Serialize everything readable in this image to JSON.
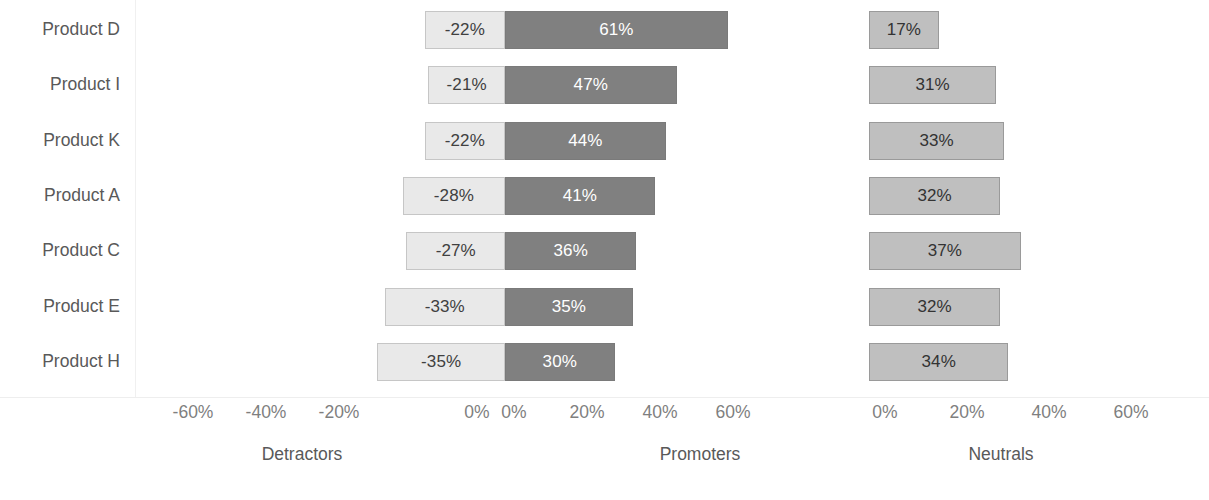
{
  "chart_data": {
    "type": "bar",
    "title": "",
    "subtitle": "",
    "xlabel": "",
    "ylabel": "",
    "orientation": "horizontal",
    "grid": false,
    "legend": "none",
    "categories": [
      "Product D",
      "Product I",
      "Product K",
      "Product A",
      "Product C",
      "Product E",
      "Product H"
    ],
    "series": [
      {
        "name": "Detractors",
        "values": [
          -22,
          -21,
          -22,
          -28,
          -27,
          -33,
          -35
        ],
        "labels": [
          "-22%",
          "-21%",
          "-22%",
          "-28%",
          "-27%",
          "-33%",
          "-35%"
        ],
        "color": "#E9E9E9",
        "border_color": "#C6C6C6",
        "label_color": "#404040",
        "panel": "left"
      },
      {
        "name": "Promoters",
        "values": [
          61,
          47,
          44,
          41,
          36,
          35,
          30
        ],
        "labels": [
          "61%",
          "47%",
          "44%",
          "41%",
          "36%",
          "35%",
          "30%"
        ],
        "color": "#808080",
        "border_color": "#7A7A7A",
        "label_color": "#FFFFFF",
        "panel": "left"
      },
      {
        "name": "Neutrals",
        "values": [
          17,
          31,
          33,
          32,
          37,
          32,
          34
        ],
        "labels": [
          "17%",
          "31%",
          "33%",
          "32%",
          "37%",
          "32%",
          "34%"
        ],
        "color": "#BFBFBF",
        "border_color": "#9A9A9A",
        "label_color": "#333333",
        "panel": "right"
      }
    ],
    "axes": [
      {
        "name": "detractors-promoters-axis",
        "panel": "left",
        "range": [
          -70,
          70
        ],
        "tick_labels": [
          "-60%",
          "-40%",
          "-20%",
          "0%",
          "0%",
          "20%",
          "40%",
          "60%"
        ],
        "tick_values": [
          -60,
          -40,
          -20,
          0,
          0,
          20,
          40,
          60
        ]
      },
      {
        "name": "neutrals-axis",
        "panel": "right",
        "range": [
          0,
          65
        ],
        "tick_labels": [
          "0%",
          "20%",
          "40%",
          "60%"
        ],
        "tick_values": [
          0,
          20,
          40,
          60
        ]
      }
    ],
    "group_titles": [
      "Detractors",
      "Promoters",
      "Neutrals"
    ]
  },
  "axis": {
    "left_ticks": [
      {
        "label": "-60%",
        "x": 193
      },
      {
        "label": "-40%",
        "x": 266
      },
      {
        "label": "-20%",
        "x": 339
      },
      {
        "label": "0%",
        "x": 477
      }
    ],
    "mid_ticks": [
      {
        "label": "0%",
        "x": 514
      },
      {
        "label": "20%",
        "x": 587
      },
      {
        "label": "40%",
        "x": 660
      },
      {
        "label": "60%",
        "x": 733
      }
    ],
    "right_ticks": [
      {
        "label": "0%",
        "x": 885
      },
      {
        "label": "20%",
        "x": 967
      },
      {
        "label": "40%",
        "x": 1049
      },
      {
        "label": "60%",
        "x": 1131
      }
    ]
  },
  "group_titles": [
    {
      "label": "Detractors",
      "x": 302
    },
    {
      "label": "Promoters",
      "x": 700
    },
    {
      "label": "Neutrals",
      "x": 1001
    }
  ]
}
